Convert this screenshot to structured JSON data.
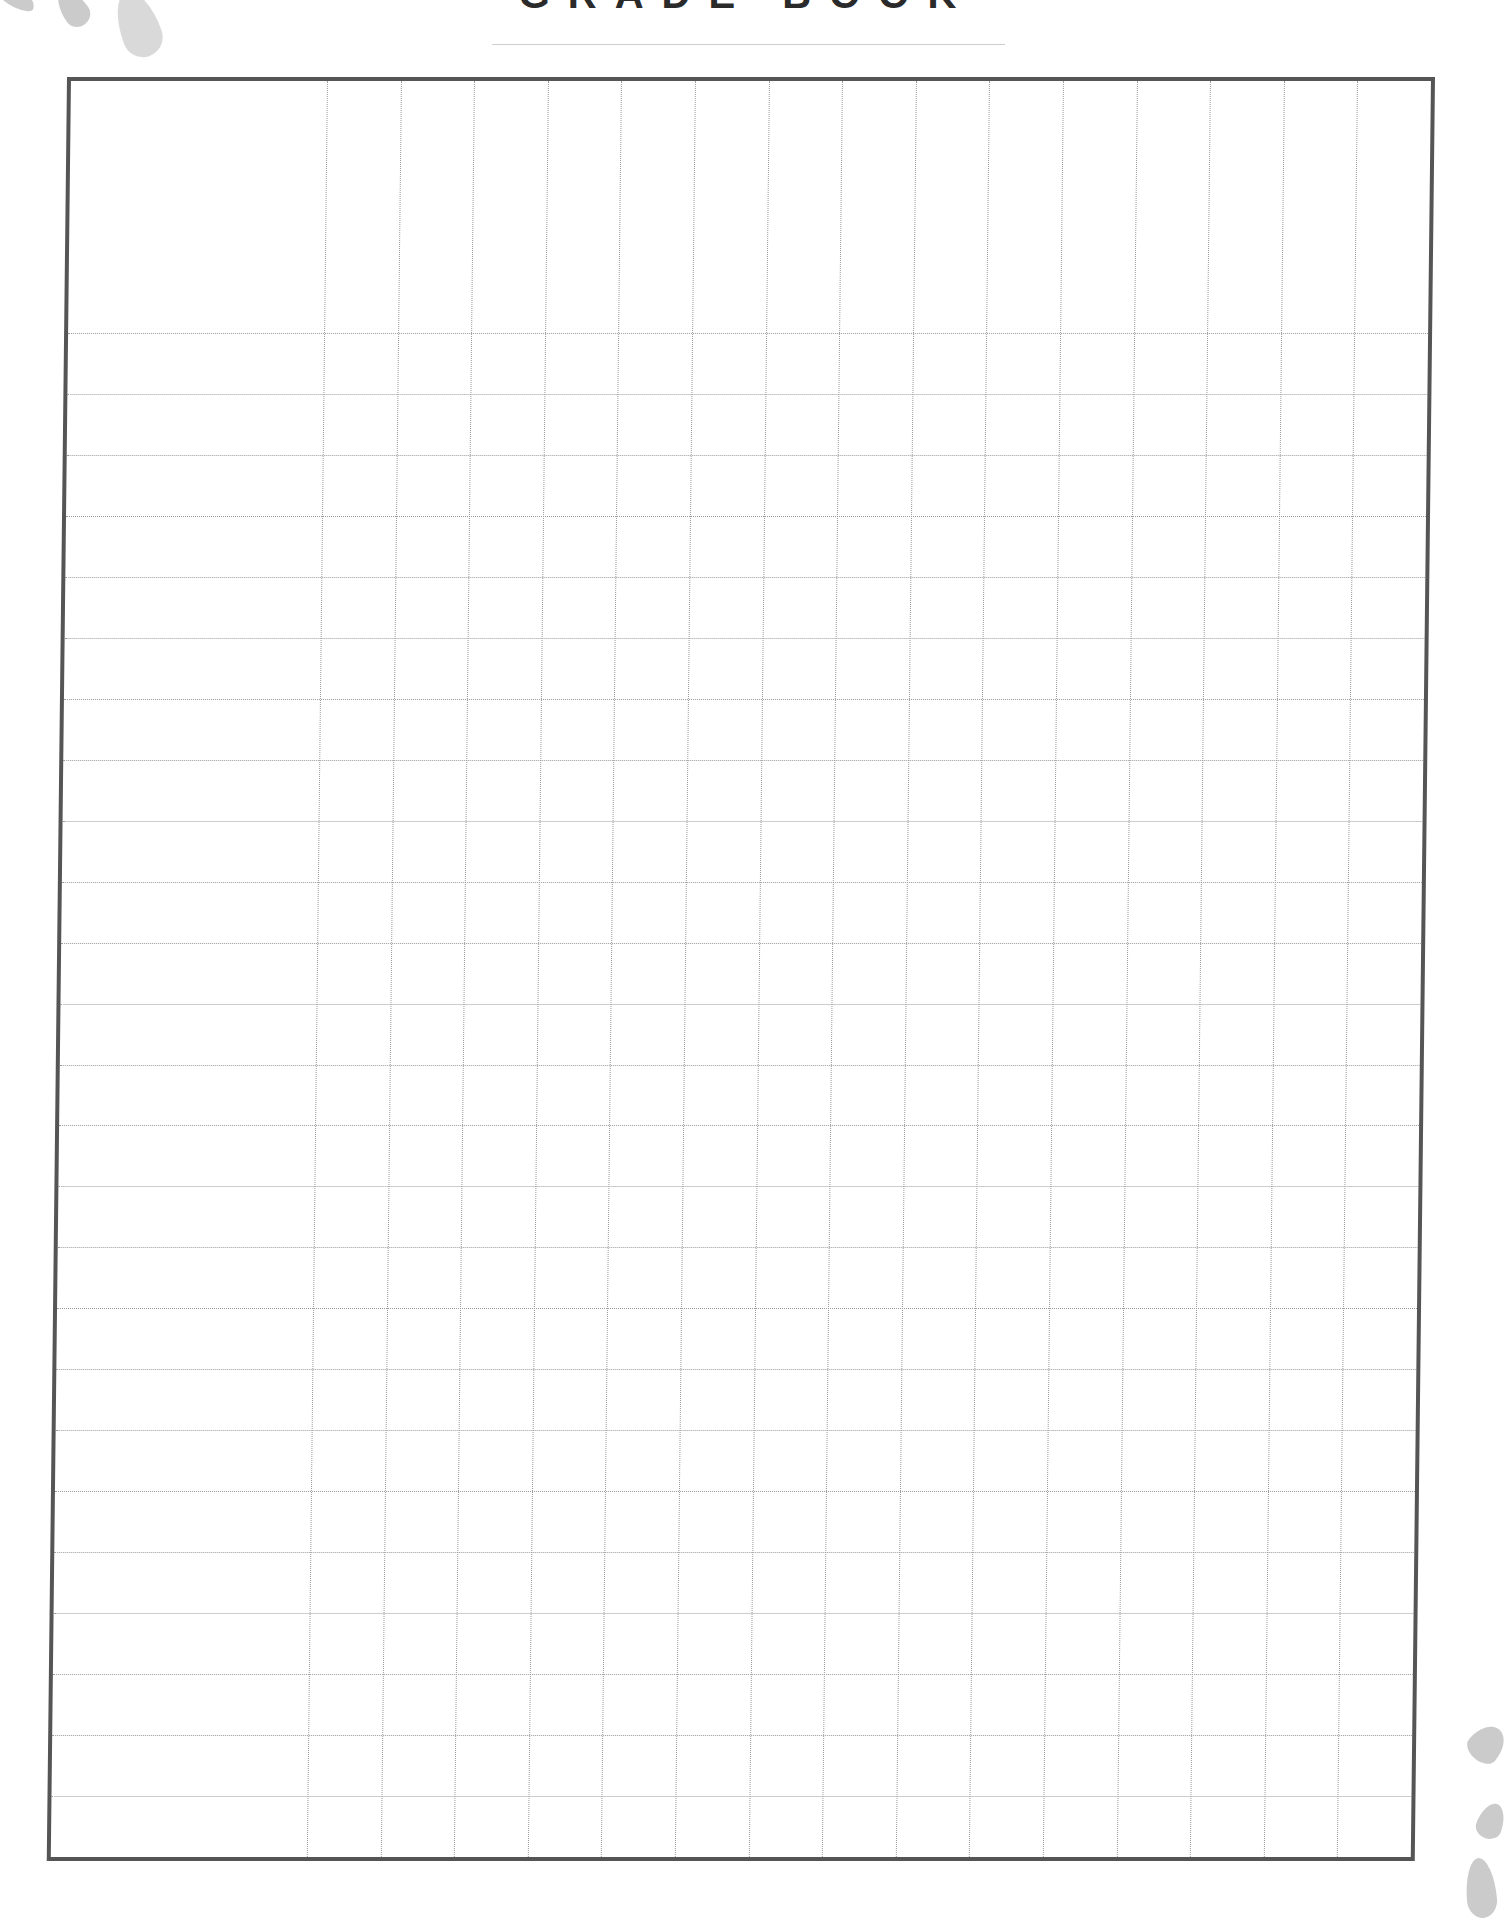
{
  "page": {
    "title": "GRADE BOOK",
    "title_visibility": "clipped at top edge — only letter bottoms visible"
  },
  "grid": {
    "name_column_count": 1,
    "score_column_count": 15,
    "header_rows": 1,
    "body_rows": 25,
    "border_color": "#555555",
    "gridline_color": "#9a9a9a",
    "gridline_style": "dotted"
  },
  "decorations": {
    "top_left": "grey-watercolor-leaves",
    "bottom_right": "grey-watercolor-leaves"
  }
}
